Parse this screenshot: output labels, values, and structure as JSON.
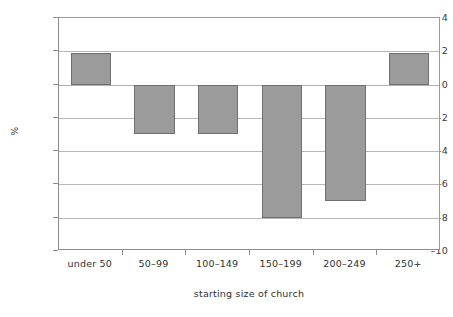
{
  "chart_data": {
    "type": "bar",
    "title": "",
    "subtitle": "",
    "xlabel": "starting size of church",
    "ylabel": "%",
    "categories": [
      "under 50",
      "50–99",
      "100–149",
      "150–199",
      "200–249",
      "250+"
    ],
    "values": [
      1.9,
      -3,
      -3,
      -8,
      -7,
      1.9
    ],
    "ylim": [
      -10,
      4
    ],
    "yticks": [
      4,
      2,
      0,
      -2,
      -4,
      -6,
      -8,
      -10
    ],
    "ytick_labels": [
      "4",
      "2",
      "0",
      "–2",
      "–4",
      "–6",
      "–8",
      "–10"
    ],
    "grid": true,
    "legend": false,
    "legend_position": "none",
    "series": [
      {
        "name": "percent change",
        "values": [
          1.9,
          -3,
          -3,
          -8,
          -7,
          1.9
        ]
      }
    ],
    "colors": {
      "bar_fill": "#9b9b9b",
      "bar_border": "#6f6f6f",
      "gridline": "#b7b7b7",
      "axis": "#8d8d8d",
      "background": "#ffffff",
      "text": "#2f2f2f"
    }
  }
}
